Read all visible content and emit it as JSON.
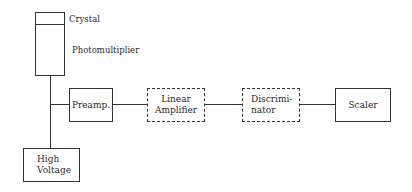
{
  "diagram": {
    "type": "block-diagram",
    "labels": {
      "crystal": "Crystal",
      "photomultiplier": "Photomultiplier",
      "preamp": "Preamp.",
      "linear_amplifier": [
        "Linear",
        "Amplifier"
      ],
      "discriminator": [
        "Discrimi-",
        "nator"
      ],
      "scaler": "Scaler",
      "high_voltage": [
        "High",
        "Voltage"
      ]
    },
    "dashed_blocks": [
      "Linear Amplifier",
      "Discriminator"
    ],
    "connections": [
      [
        "Photomultiplier",
        "High Voltage"
      ],
      [
        "Photomultiplier",
        "Preamp."
      ],
      [
        "Preamp.",
        "Linear Amplifier"
      ],
      [
        "Linear Amplifier",
        "Discriminator"
      ],
      [
        "Discriminator",
        "Scaler"
      ]
    ]
  }
}
